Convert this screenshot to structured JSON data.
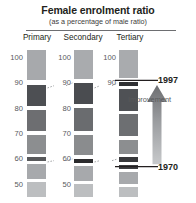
{
  "header": {
    "title": "Female enrolment ratio",
    "subtitle": "(as a percentage of male ratio)"
  },
  "annotations": {
    "year_top": "1997",
    "year_bottom": "1970",
    "improvement": "Improvement"
  },
  "chart_data": {
    "type": "bar",
    "title": "Female enrolment ratio",
    "subtitle": "(as a percentage of male ratio)",
    "xlabel": "",
    "ylabel": "",
    "ylim": [
      45,
      103
    ],
    "grid": false,
    "legend_position": "none",
    "note": "Three vertical banded strips (one per education level). Each strip is a stack of shaded bands; darker bands mark the female:male enrolment ratio reached in 1970 and 1997. Dashed leader lines link the 90 and 60 gridline levels across the three strips. A vertical arrow on the right indicates direction of improvement from 1970 up to 1997.",
    "categories": [
      "Primary",
      "Secondary",
      "Tertiary"
    ],
    "tick_labels": [
      "100",
      "90",
      "80",
      "70",
      "60",
      "50"
    ],
    "tick_values": [
      100,
      90,
      80,
      70,
      60,
      50
    ],
    "series": [
      {
        "name": "1970",
        "values": [
          60,
          59,
          57
        ]
      },
      {
        "name": "1997",
        "values": [
          90,
          90,
          91
        ]
      }
    ],
    "columns": [
      {
        "label": "Primary",
        "ticks": [
          100,
          90,
          80,
          70,
          60,
          50
        ],
        "value_1970": 60,
        "value_1997": 90,
        "bands": [
          {
            "from": 103,
            "to": 91,
            "color": "#a7a9ac"
          },
          {
            "from": 91,
            "to": 89,
            "color": "#ffffff"
          },
          {
            "from": 89,
            "to": 81,
            "color": "#4d4f53"
          },
          {
            "from": 81,
            "to": 79.5,
            "color": "#ffffff"
          },
          {
            "from": 79.5,
            "to": 71,
            "color": "#6d6e71"
          },
          {
            "from": 71,
            "to": 69.5,
            "color": "#ffffff"
          },
          {
            "from": 69.5,
            "to": 62,
            "color": "#8c8e90"
          },
          {
            "from": 62,
            "to": 60.8,
            "color": "#ffffff"
          },
          {
            "from": 60.8,
            "to": 59.2,
            "color": "#58595b"
          },
          {
            "from": 59.2,
            "to": 58,
            "color": "#ffffff"
          },
          {
            "from": 58,
            "to": 52,
            "color": "#a7a9ac"
          },
          {
            "from": 52,
            "to": 50.8,
            "color": "#ffffff"
          },
          {
            "from": 50.8,
            "to": 45,
            "color": "#bcbec0"
          }
        ]
      },
      {
        "label": "Secondary",
        "ticks": [
          100,
          90,
          80,
          70,
          60,
          50
        ],
        "value_1970": 59,
        "value_1997": 90,
        "bands": [
          {
            "from": 103,
            "to": 91.5,
            "color": "#a9abae"
          },
          {
            "from": 91.5,
            "to": 90,
            "color": "#ffffff"
          },
          {
            "from": 90,
            "to": 81.5,
            "color": "#4a4c50"
          },
          {
            "from": 81.5,
            "to": 80,
            "color": "#ffffff"
          },
          {
            "from": 80,
            "to": 71,
            "color": "#6a6c6f"
          },
          {
            "from": 71,
            "to": 69.5,
            "color": "#ffffff"
          },
          {
            "from": 69.5,
            "to": 61.5,
            "color": "#8a8c8e"
          },
          {
            "from": 61.5,
            "to": 60,
            "color": "#ffffff"
          },
          {
            "from": 60,
            "to": 58.4,
            "color": "#2b2b2d"
          },
          {
            "from": 58.4,
            "to": 57.2,
            "color": "#ffffff"
          },
          {
            "from": 57.2,
            "to": 51.5,
            "color": "#a7a9ac"
          },
          {
            "from": 51.5,
            "to": 50.2,
            "color": "#ffffff"
          },
          {
            "from": 50.2,
            "to": 45,
            "color": "#bcbec0"
          }
        ]
      },
      {
        "label": "Tertiary",
        "ticks": [
          100,
          90
        ],
        "value_1970": 57,
        "value_1997": 91,
        "bands": [
          {
            "from": 103,
            "to": 92,
            "color": "#a9abae"
          },
          {
            "from": 92,
            "to": 90.5,
            "color": "#ffffff"
          },
          {
            "from": 90.5,
            "to": 88.8,
            "color": "#303134"
          },
          {
            "from": 88.8,
            "to": 87.6,
            "color": "#ffffff"
          },
          {
            "from": 87.6,
            "to": 79,
            "color": "#4f5155"
          },
          {
            "from": 79,
            "to": 77.6,
            "color": "#ffffff"
          },
          {
            "from": 77.6,
            "to": 69,
            "color": "#6d6f72"
          },
          {
            "from": 69,
            "to": 67.6,
            "color": "#ffffff"
          },
          {
            "from": 67.6,
            "to": 62,
            "color": "#8c8e90"
          },
          {
            "from": 62,
            "to": 60.6,
            "color": "#ffffff"
          },
          {
            "from": 60.6,
            "to": 59,
            "color": "#38393c"
          },
          {
            "from": 59,
            "to": 57.8,
            "color": "#ffffff"
          },
          {
            "from": 57.8,
            "to": 56.2,
            "color": "#3d3e41"
          },
          {
            "from": 56.2,
            "to": 55,
            "color": "#ffffff"
          },
          {
            "from": 55,
            "to": 50,
            "color": "#a7a9ac"
          },
          {
            "from": 50,
            "to": 48.8,
            "color": "#ffffff"
          },
          {
            "from": 48.8,
            "to": 45,
            "color": "#bcbec0"
          }
        ]
      }
    ],
    "connectors": [
      {
        "level": 90,
        "label": "90",
        "from_column": 0,
        "to_column": 1
      },
      {
        "level": 90,
        "label": "90",
        "from_column": 1,
        "to_column": 2
      },
      {
        "level": 60,
        "label": "60",
        "from_column": 0,
        "to_column": 1
      },
      {
        "level": 60,
        "label": "60",
        "from_column": 1,
        "to_column": 2
      }
    ]
  },
  "colors": {
    "text": "#231f20",
    "tick_text": "#58595b",
    "rule": "#6d6e71",
    "arrow": "#939598",
    "background": "#ffffff"
  }
}
